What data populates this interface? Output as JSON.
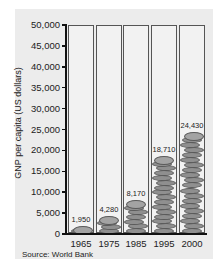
{
  "chart_data": {
    "type": "bar",
    "title": "",
    "xlabel": "",
    "ylabel": "GNP per capita (US dollars)",
    "categories": [
      "1965",
      "1975",
      "1985",
      "1995",
      "2000"
    ],
    "values": [
      1950,
      4280,
      8170,
      18710,
      24430
    ],
    "value_labels": [
      "1,950",
      "4,280",
      "8,170",
      "18,710",
      "24,430"
    ],
    "ylim": [
      0,
      50000
    ],
    "yticks": [
      0,
      5000,
      10000,
      15000,
      20000,
      25000,
      30000,
      35000,
      40000,
      45000,
      50000
    ],
    "ytick_labels": [
      "0",
      "5,000",
      "10,000",
      "15,000",
      "20,000",
      "25,000",
      "30,000",
      "35,000",
      "40,000",
      "45,000",
      "50,000"
    ],
    "grid": false,
    "legend": null,
    "style": "pictograph bars as stacks of coins inside tubes",
    "source": "Source: World Bank"
  },
  "colors": {
    "background": "#ececec",
    "coin": "#8f8f8f",
    "coin_edge": "#5a5a5a",
    "axis": "#111111"
  }
}
